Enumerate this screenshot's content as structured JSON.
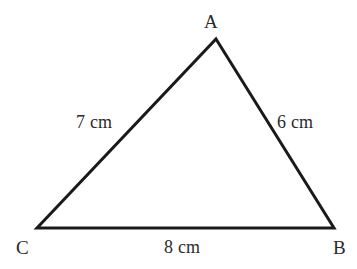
{
  "figure": {
    "kind": "triangle-diagram",
    "background_color": "#ffffff",
    "stroke_color": "#1a1a1a",
    "stroke_width": 3,
    "text_color": "#2b2b2b"
  },
  "vertices": [
    {
      "id": "A",
      "label": "A",
      "x": 216,
      "y": 39
    },
    {
      "id": "B",
      "label": "B",
      "x": 334,
      "y": 228
    },
    {
      "id": "C",
      "label": "C",
      "x": 37,
      "y": 228
    }
  ],
  "sides": [
    {
      "id": "CA",
      "from": "C",
      "to": "A",
      "label": "7 cm",
      "value": 7,
      "unit": "cm"
    },
    {
      "id": "AB",
      "from": "A",
      "to": "B",
      "label": "6 cm",
      "value": 6,
      "unit": "cm"
    },
    {
      "id": "CB",
      "from": "C",
      "to": "B",
      "label": "8 cm",
      "value": 8,
      "unit": "cm"
    }
  ]
}
